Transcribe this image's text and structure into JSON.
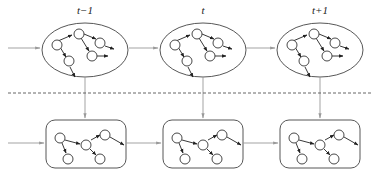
{
  "diagram": {
    "type": "temporal-graph-sequence",
    "colors": {
      "stroke": "#444444",
      "flow_arrow": "#999999",
      "dashed_separator": "#555555",
      "node_fill": "#ffffff",
      "background": "#ffffff"
    },
    "time_labels": [
      "t−1",
      "t",
      "t+1"
    ],
    "top_row": {
      "shape": "ellipse",
      "count": 3
    },
    "bottom_row": {
      "shape": "rounded-rectangle",
      "count": 3
    },
    "separator": "dashed-horizontal-line"
  }
}
